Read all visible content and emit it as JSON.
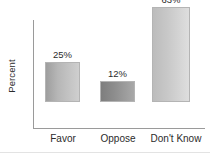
{
  "chart_data": {
    "type": "bar",
    "title": "",
    "xlabel": "",
    "ylabel": "Percent",
    "categories": [
      "Favor",
      "Oppose",
      "Don't Know"
    ],
    "values": [
      25,
      12,
      63
    ],
    "value_labels": [
      "25%",
      "12%",
      "63%"
    ],
    "ylim": [
      0,
      70
    ],
    "grid": false,
    "legend": "none",
    "bar_colors": [
      "#b6b6b6",
      "#8d8d8d",
      "#c8c8c8"
    ],
    "axis_color": "#9a9a9a",
    "text_color": "#2b2b2b",
    "background": "#ffffff"
  }
}
